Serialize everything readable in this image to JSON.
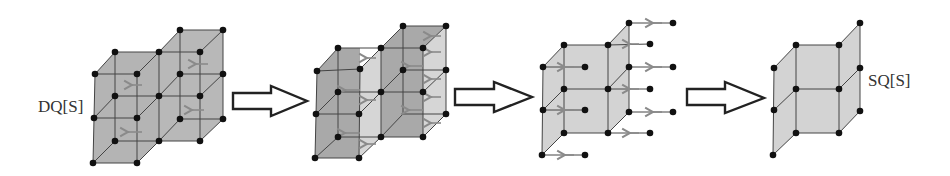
{
  "diagram": {
    "labels": {
      "start": "DQ[S]",
      "end": "SQ[S]"
    },
    "stages": [
      {
        "id": "stage-1",
        "description": "Two stacked 2x2x2 cube lattice blocks (DQ[S]) with arrows on inner edges"
      },
      {
        "id": "stage-2",
        "description": "Blocks with shifted faces highlighted, arrows indicating contraction"
      },
      {
        "id": "stage-3",
        "description": "Single lattice with dangling edges and arrows pointing inward"
      },
      {
        "id": "stage-4",
        "description": "Resulting reduced lattice SQ[S]"
      }
    ],
    "transitions": 3,
    "colors": {
      "fill_dark": "#b4b4b4",
      "fill_mid": "#a9a9a9",
      "fill_light": "#d6d6d6",
      "node": "#111111",
      "edge": "#444444",
      "ghost_arrow": "#8a8a8a"
    }
  }
}
